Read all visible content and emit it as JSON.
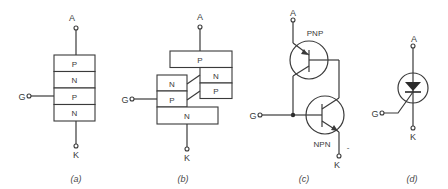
{
  "figure": {
    "panels": [
      {
        "id": "a",
        "caption": "(a)",
        "description": "Four-layer PNPN structure",
        "terminals": {
          "anode": "A",
          "gate": "G",
          "cathode": "K"
        },
        "layers": [
          "P",
          "N",
          "P",
          "N"
        ]
      },
      {
        "id": "b",
        "caption": "(b)",
        "description": "Split two-transistor structure",
        "terminals": {
          "anode": "A",
          "gate": "G",
          "cathode": "K"
        },
        "upper_block": [
          "P",
          "N",
          "P"
        ],
        "lower_block": [
          "N",
          "P",
          "N"
        ]
      },
      {
        "id": "c",
        "caption": "(c)",
        "description": "Two-transistor equivalent circuit",
        "terminals": {
          "anode": "A",
          "gate": "G",
          "cathode": "K"
        },
        "transistors": [
          "PNP",
          "NPN"
        ],
        "mark": "-"
      },
      {
        "id": "d",
        "caption": "(d)",
        "description": "SCR circuit symbol",
        "terminals": {
          "anode": "A",
          "gate": "G",
          "cathode": "K"
        }
      }
    ]
  }
}
